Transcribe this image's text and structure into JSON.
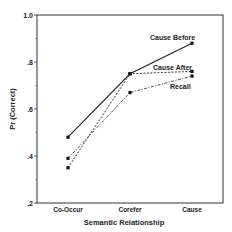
{
  "chart_data": {
    "type": "line",
    "title": "",
    "xlabel": "Semantic Relationship",
    "ylabel": "Pr (Correct)",
    "categories": [
      "Co-Occur",
      "Corefer",
      "Cause"
    ],
    "ylim": [
      0.2,
      1.0
    ],
    "yticks": [
      ".2",
      ".4",
      ".6",
      ".8",
      "1.0"
    ],
    "grid": false,
    "legend_position": "inline labels near line ends",
    "series": [
      {
        "name": "Cause Before",
        "values": [
          0.48,
          0.75,
          0.88
        ],
        "style": "solid"
      },
      {
        "name": "Cause After",
        "values": [
          0.35,
          0.75,
          0.76
        ],
        "style": "dashed"
      },
      {
        "name": "Recall",
        "values": [
          0.39,
          0.67,
          0.74
        ],
        "style": "dash-dot"
      }
    ]
  }
}
